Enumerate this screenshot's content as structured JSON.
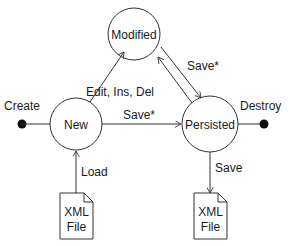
{
  "diagram": {
    "type": "state-diagram",
    "states": [
      {
        "id": "modified",
        "label": "Modified"
      },
      {
        "id": "new",
        "label": "New"
      },
      {
        "id": "persisted",
        "label": "Persisted"
      }
    ],
    "pseudostates": [
      {
        "id": "create",
        "label": "Create"
      },
      {
        "id": "destroy",
        "label": "Destroy"
      }
    ],
    "documents": [
      {
        "id": "xml-file-input",
        "line1": "XML",
        "line2": "File"
      },
      {
        "id": "xml-file-output",
        "line1": "XML",
        "line2": "File"
      }
    ],
    "transitions": [
      {
        "from": "create",
        "to": "new",
        "label": ""
      },
      {
        "from": "new",
        "to": "modified",
        "label": ""
      },
      {
        "from": "persisted",
        "to": "modified",
        "label": "Edit, Ins, Del"
      },
      {
        "from": "modified",
        "to": "persisted",
        "label": "Save*"
      },
      {
        "from": "new",
        "to": "persisted",
        "label": "Save*"
      },
      {
        "from": "persisted",
        "to": "destroy",
        "label": ""
      },
      {
        "from": "xml-file-input",
        "to": "new",
        "label": "Load"
      },
      {
        "from": "persisted",
        "to": "xml-file-output",
        "label": "Save"
      }
    ]
  },
  "labels": {
    "modified": "Modified",
    "new": "New",
    "persisted": "Persisted",
    "create": "Create",
    "destroy": "Destroy",
    "edit_ins_del": "Edit, Ins, Del",
    "save_star_top": "Save*",
    "save_star_mid": "Save*",
    "load": "Load",
    "save": "Save",
    "xml_left_1": "XML",
    "xml_left_2": "File",
    "xml_right_1": "XML",
    "xml_right_2": "File"
  },
  "colors": {
    "stroke": "#333333",
    "text": "#1a1a1a",
    "background": "#ffffff"
  }
}
